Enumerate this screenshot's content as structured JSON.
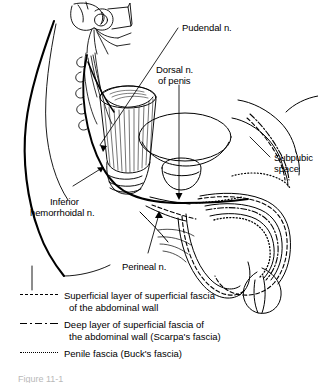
{
  "figure": {
    "background_color": "#ffffff",
    "line_color": "#000000",
    "width": 318,
    "height": 383,
    "caption_partial": "Figure 11-1"
  },
  "labels": [
    {
      "id": "pudendal-nerve",
      "text": "Pudendal n."
    },
    {
      "id": "dorsal-nerve-of-penis-1",
      "text": "Dorsal n."
    },
    {
      "id": "dorsal-nerve-of-penis-2",
      "text": "of penis"
    },
    {
      "id": "subpubic-space-1",
      "text": "Subpubic"
    },
    {
      "id": "subpubic-space-2",
      "text": "space"
    },
    {
      "id": "inferior-hemorrhoidal-1",
      "text": "Inferior"
    },
    {
      "id": "inferior-hemorrhoidal-2",
      "text": "hemorrhoidal n."
    },
    {
      "id": "perineal-nerve",
      "text": "Perineal n."
    }
  ],
  "legend": {
    "items": [
      {
        "id": "superficial-layer",
        "line_style": "dashed",
        "line1": "Superficial layer of superficial fascia",
        "line2": "of the abdominal wall"
      },
      {
        "id": "deep-layer-scarpas",
        "line_style": "dash-dot",
        "line1": "Deep layer of superficial fascia of",
        "line2": "the abdominal wall (Scarpa's fascia)"
      },
      {
        "id": "penile-fascia-bucks",
        "line_style": "dotted",
        "line1": "Penile fascia (Buck's fascia)",
        "line2": ""
      }
    ]
  }
}
